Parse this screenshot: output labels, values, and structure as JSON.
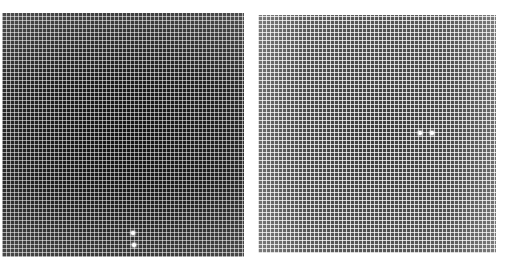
{
  "panels": [
    {
      "id": "left",
      "description": "Dark grid-pattern micrograph with two bright spots near bottom center",
      "bright_spots": [
        {
          "x": 133,
          "y": 233
        },
        {
          "x": 134,
          "y": 245
        }
      ]
    },
    {
      "id": "right",
      "description": "Lighter grid-pattern micrograph with two bright spots near center-right",
      "bright_spots": [
        {
          "x": 420,
          "y": 133
        },
        {
          "x": 432,
          "y": 133
        }
      ]
    }
  ]
}
